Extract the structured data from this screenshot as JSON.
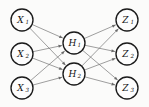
{
  "diagram": {
    "background_color": "#fbfbfa",
    "node_fill_color": "#fdfdfd",
    "node_stroke_color": "#1b1b1b",
    "edge_color": "#6b6b6b",
    "label_color": "#121212",
    "node_radius": 11,
    "layers": [
      {
        "name": "input-layer",
        "nodes": [
          {
            "id": "X1",
            "base": "X",
            "sub": "1",
            "cx": 22,
            "cy": 20
          },
          {
            "id": "X2",
            "base": "X",
            "sub": "2",
            "cx": 22,
            "cy": 54
          },
          {
            "id": "X3",
            "base": "X",
            "sub": "3",
            "cx": 22,
            "cy": 88
          }
        ]
      },
      {
        "name": "hidden-layer",
        "nodes": [
          {
            "id": "H1",
            "base": "H",
            "sub": "1",
            "cx": 74,
            "cy": 43
          },
          {
            "id": "H2",
            "base": "H",
            "sub": "2",
            "cx": 74,
            "cy": 74
          }
        ]
      },
      {
        "name": "output-layer",
        "nodes": [
          {
            "id": "Z1",
            "base": "Z",
            "sub": "1",
            "cx": 127,
            "cy": 20
          },
          {
            "id": "Z2",
            "base": "Z",
            "sub": "2",
            "cx": 127,
            "cy": 54
          },
          {
            "id": "Z3",
            "base": "Z",
            "sub": "3",
            "cx": 127,
            "cy": 88
          }
        ]
      }
    ],
    "edges": [
      {
        "from": "X1",
        "to": "H1"
      },
      {
        "from": "X1",
        "to": "H2"
      },
      {
        "from": "X2",
        "to": "H1"
      },
      {
        "from": "X2",
        "to": "H2"
      },
      {
        "from": "X3",
        "to": "H1"
      },
      {
        "from": "X3",
        "to": "H2"
      },
      {
        "from": "H1",
        "to": "Z1"
      },
      {
        "from": "H1",
        "to": "Z2"
      },
      {
        "from": "H1",
        "to": "Z3"
      },
      {
        "from": "H2",
        "to": "Z1"
      },
      {
        "from": "H2",
        "to": "Z2"
      },
      {
        "from": "H2",
        "to": "Z3"
      }
    ]
  }
}
